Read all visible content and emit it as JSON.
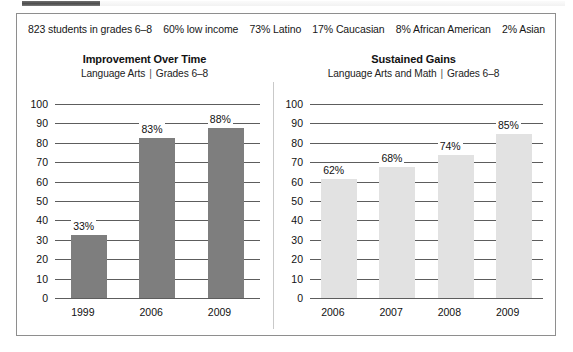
{
  "demographics": {
    "items": [
      "823 students in grades 6–8",
      "60% low income",
      "73% Latino",
      "17% Caucasian",
      "8% African American",
      "2% Asian"
    ]
  },
  "colors": {
    "bar_dark": "#7e7e7e",
    "bar_light": "#e2e2e2",
    "gridline": "#5d5d5d",
    "border": "#8e8e8e",
    "divider": "#c9c9c9"
  },
  "separator": "|",
  "chart_data": [
    {
      "type": "bar",
      "title": "Improvement Over Time",
      "subtitle_subject": "Language Arts",
      "subtitle_grades": "Grades 6–8",
      "xlabel": "",
      "ylabel": "",
      "ylim": [
        0,
        100
      ],
      "yticks": [
        100,
        90,
        80,
        70,
        60,
        50,
        40,
        30,
        20,
        10,
        0
      ],
      "ytick_labels": [
        "100",
        "90",
        "80",
        "70",
        "60",
        "50",
        "40",
        "30",
        "20",
        "10",
        "0"
      ],
      "grid": true,
      "legend": "none",
      "bar_color": "#7e7e7e",
      "categories": [
        "1999",
        "2006",
        "2009"
      ],
      "values": [
        33,
        83,
        88
      ],
      "value_labels": [
        "33%",
        "83%",
        "88%"
      ]
    },
    {
      "type": "bar",
      "title": "Sustained Gains",
      "subtitle_subject": "Language Arts and Math",
      "subtitle_grades": "Grades 6–8",
      "xlabel": "",
      "ylabel": "",
      "ylim": [
        0,
        100
      ],
      "yticks": [
        100,
        90,
        80,
        70,
        60,
        50,
        40,
        30,
        20,
        10,
        0
      ],
      "ytick_labels": [
        "100",
        "90",
        "80",
        "70",
        "60",
        "50",
        "40",
        "30",
        "20",
        "10",
        "0"
      ],
      "grid": true,
      "legend": "none",
      "bar_color": "#e2e2e2",
      "categories": [
        "2006",
        "2007",
        "2008",
        "2009"
      ],
      "values": [
        62,
        68,
        74,
        85
      ],
      "value_labels": [
        "62%",
        "68%",
        "74%",
        "85%"
      ]
    }
  ]
}
